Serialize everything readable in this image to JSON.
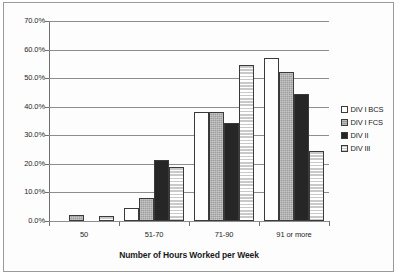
{
  "chart_data": {
    "type": "bar",
    "title": "",
    "xlabel": "Number of Hours Worked per Week",
    "ylabel": "",
    "categories": [
      "50",
      "51-70",
      "71-90",
      "91 or more"
    ],
    "series": [
      {
        "name": "DIV I BCS",
        "values": [
          0.0,
          4.5,
          38.0,
          57.2
        ],
        "swatch": "white"
      },
      {
        "name": "DIV I FCS",
        "values": [
          2.1,
          8.0,
          38.0,
          52.0
        ],
        "swatch": "gray"
      },
      {
        "name": "DIV II",
        "values": [
          0.0,
          21.3,
          34.2,
          44.6
        ],
        "swatch": "black"
      },
      {
        "name": "DIV III",
        "values": [
          1.8,
          18.8,
          54.5,
          24.6
        ],
        "swatch": "horizontal-stripes"
      }
    ],
    "ylim": [
      0,
      70
    ],
    "ytick_labels": [
      "0.0%",
      "10.0%",
      "20.0%",
      "30.0%",
      "40.0%",
      "50.0%",
      "60.0%",
      "70.0%"
    ],
    "ytick_values": [
      0,
      10,
      20,
      30,
      40,
      50,
      60,
      70
    ],
    "grid": true,
    "legend_position": "right"
  },
  "legend": {
    "entries": [
      {
        "label": "DIV I BCS"
      },
      {
        "label": "DIV I FCS"
      },
      {
        "label": "DIV II"
      },
      {
        "label": "DIV III"
      }
    ]
  },
  "axis": {
    "x_title": "Number of Hours Worked per Week"
  }
}
